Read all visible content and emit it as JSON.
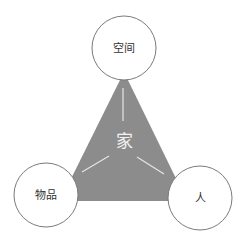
{
  "diagram": {
    "center": {
      "label": "家"
    },
    "nodes": [
      {
        "id": "space",
        "label": "空间"
      },
      {
        "id": "things",
        "label": "物品"
      },
      {
        "id": "people",
        "label": "人"
      }
    ],
    "colors": {
      "triangle_fill": "#8c8c8c",
      "circle_fill": "#ffffff",
      "circle_stroke": "#7a7a7a",
      "arrow": "#e6e6e6"
    }
  }
}
